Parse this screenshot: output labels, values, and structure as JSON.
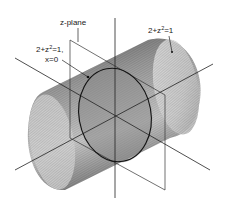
{
  "figure": {
    "labels": {
      "plane": "z-plane",
      "circle_eq_prefix": "2+z",
      "circle_eq_exp": "2",
      "circle_eq_suffix": "=1,",
      "circle_cond": "x=0",
      "cyl_eq_prefix": "2+z",
      "cyl_eq_exp": "2",
      "cyl_eq_suffix": "=1"
    },
    "colors": {
      "line": "#222222",
      "shade_dark": "#6a6a6a",
      "shade_light": "#d8d8d8",
      "background": "#ffffff"
    }
  }
}
